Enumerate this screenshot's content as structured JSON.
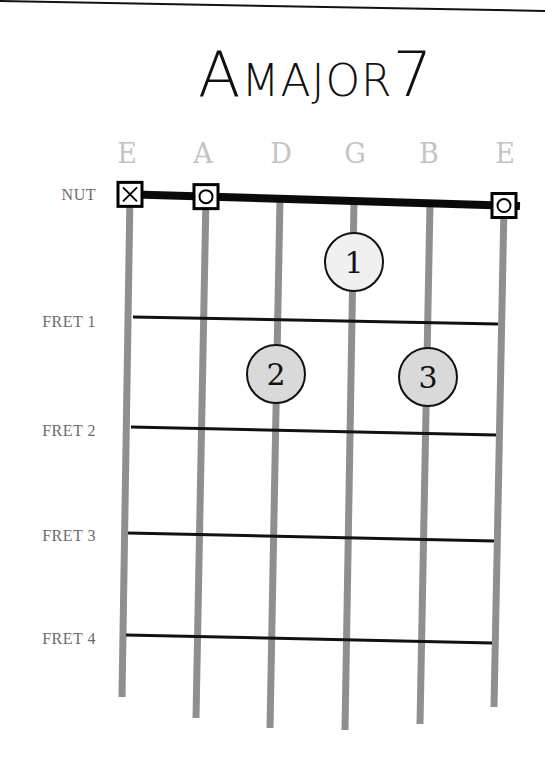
{
  "title": {
    "prefix": "A",
    "word": "MAJOR",
    "suffix": "7",
    "full": "A MAJOR 7"
  },
  "strings": [
    {
      "name": "E",
      "marker": "muted",
      "marker_glyph": "X",
      "top_x": 130,
      "bottom_x": 122,
      "bottom_y": 697
    },
    {
      "name": "A",
      "marker": "open",
      "marker_glyph": "O",
      "top_x": 206,
      "bottom_x": 196,
      "bottom_y": 718
    },
    {
      "name": "D",
      "marker": "none",
      "marker_glyph": "",
      "top_x": 280,
      "bottom_x": 270,
      "bottom_y": 728
    },
    {
      "name": "G",
      "marker": "none",
      "marker_glyph": "",
      "top_x": 354,
      "bottom_x": 345,
      "bottom_y": 730
    },
    {
      "name": "B",
      "marker": "none",
      "marker_glyph": "",
      "top_x": 430,
      "bottom_x": 420,
      "bottom_y": 724
    },
    {
      "name": "E",
      "marker": "open",
      "marker_glyph": "O",
      "top_x": 504,
      "bottom_x": 494,
      "bottom_y": 707
    }
  ],
  "string_name_positions": [
    {
      "x": 112
    },
    {
      "x": 188
    },
    {
      "x": 266
    },
    {
      "x": 340
    },
    {
      "x": 414
    },
    {
      "x": 490
    }
  ],
  "nut": {
    "label": "NUT",
    "y_left": 194,
    "y_right": 206,
    "x_left": 118,
    "x_right": 520,
    "label_y": 186
  },
  "frets": [
    {
      "label": "FRET 1",
      "x1": 133,
      "y1": 317,
      "x2": 498,
      "y2": 324,
      "label_y": 313
    },
    {
      "label": "FRET 2",
      "x1": 131,
      "y1": 427,
      "x2": 496,
      "y2": 435,
      "label_y": 422
    },
    {
      "label": "FRET 3",
      "x1": 128,
      "y1": 533,
      "x2": 494,
      "y2": 541,
      "label_y": 527
    },
    {
      "label": "FRET 4",
      "x1": 126,
      "y1": 635,
      "x2": 492,
      "y2": 643,
      "label_y": 630
    }
  ],
  "fingers": [
    {
      "finger": "1",
      "string": "G",
      "fret": 1,
      "cx": 354,
      "cy": 262,
      "fill": "#f0f0f0"
    },
    {
      "finger": "2",
      "string": "D",
      "fret": 2,
      "cx": 276,
      "cy": 374,
      "fill": "#d9d9d9"
    },
    {
      "finger": "3",
      "string": "B",
      "fret": 2,
      "cx": 428,
      "cy": 377,
      "fill": "#d9d9d9"
    }
  ],
  "colors": {
    "string": "#8f8f8f",
    "fret": "#111111",
    "nut": "#0a0a0a",
    "string_name": "#c4c4c4",
    "fret_label": "#6b6b6b",
    "background": "#ffffff"
  }
}
